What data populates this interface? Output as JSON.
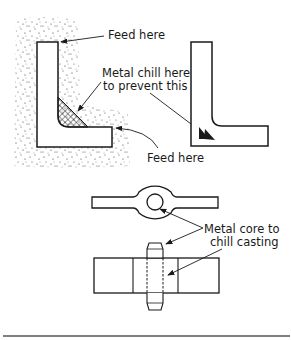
{
  "figure": {
    "label_feed_top": "Feed here",
    "label_chill_line1": "Metal chill here",
    "label_chill_line2": "to prevent this",
    "label_feed_bottom": "Feed here",
    "label_core_line1": "Metal core to",
    "label_core_line2": "chill casting"
  },
  "colors": {
    "line": "#1a1a1a",
    "background": "#ffffff",
    "rule": "#555555"
  }
}
